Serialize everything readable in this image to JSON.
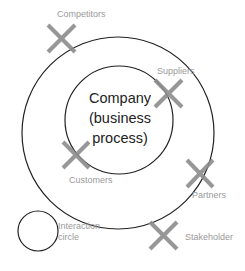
{
  "diagram": {
    "center": {
      "lines": [
        "Company",
        "(business",
        "process)"
      ]
    },
    "stakeholders": [
      {
        "label": "Competitors",
        "position": "outside outer circle, top-left"
      },
      {
        "label": "Suppliers",
        "position": "on inner circle, right"
      },
      {
        "label": "Customers",
        "position": "on inner circle, bottom-left"
      },
      {
        "label": "Partners",
        "position": "on outer circle, bottom-right"
      }
    ],
    "legend": {
      "circle_label_line1": "Interaction",
      "circle_label_line2": "circle",
      "stakeholder_label": "Stakeholder"
    },
    "colors": {
      "circle_stroke": "#222222",
      "cross_stroke": "#8c8c8c",
      "label_text": "#9a9a9a"
    }
  }
}
